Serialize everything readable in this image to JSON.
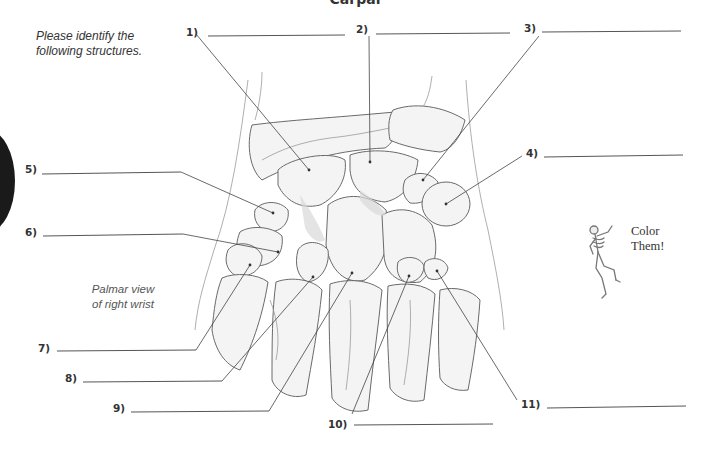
{
  "page": {
    "title_partial": "Carpal",
    "instructions": [
      "Please identify the",
      "following structures."
    ],
    "caption": [
      "Palmar view",
      "of right wrist"
    ],
    "color_note": [
      "Color",
      "Them!"
    ]
  },
  "labels": [
    {
      "num": "1)",
      "x": 186,
      "y": 26,
      "line": [
        208,
        36,
        345,
        35
      ],
      "target": [
        309,
        170
      ]
    },
    {
      "num": "2)",
      "x": 356,
      "y": 23,
      "line": [
        376,
        34,
        510,
        33
      ],
      "target": [
        370,
        162
      ]
    },
    {
      "num": "3)",
      "x": 524,
      "y": 22,
      "line": [
        542,
        32,
        681,
        31
      ],
      "target": [
        423,
        180
      ]
    },
    {
      "num": "4)",
      "x": 526,
      "y": 147,
      "line": [
        544,
        157,
        683,
        155
      ],
      "target": [
        446,
        204
      ]
    },
    {
      "num": "5)",
      "x": 25,
      "y": 163,
      "line": [
        42,
        174,
        181,
        172
      ],
      "target": [
        273,
        213
      ]
    },
    {
      "num": "6)",
      "x": 25,
      "y": 226,
      "line": [
        43,
        236,
        183,
        234
      ],
      "target": [
        278,
        252
      ]
    },
    {
      "num": "7)",
      "x": 38,
      "y": 342,
      "line": [
        57,
        351,
        196,
        350
      ],
      "target": [
        250,
        265
      ]
    },
    {
      "num": "8)",
      "x": 65,
      "y": 372,
      "line": [
        83,
        382,
        222,
        381
      ],
      "target": [
        313,
        277
      ]
    },
    {
      "num": "9)",
      "x": 113,
      "y": 402,
      "line": [
        131,
        412,
        269,
        411
      ],
      "target": [
        352,
        273
      ]
    },
    {
      "num": "10)",
      "x": 328,
      "y": 418,
      "line": [
        354,
        425,
        493,
        424
      ],
      "target": [
        409,
        276
      ]
    },
    {
      "num": "11)",
      "x": 521,
      "y": 398,
      "line": [
        547,
        408,
        686,
        406
      ],
      "target": [
        437,
        271
      ]
    }
  ],
  "icons": {
    "skeleton": "dancing-skeleton-icon",
    "tab_marker": "black-half-circle"
  },
  "colors": {
    "text": "#333333",
    "line": "#555555",
    "bone_fill": "#f4f4f4",
    "bone_stroke": "#6a6a6a",
    "tab": "#1a1a1a"
  }
}
